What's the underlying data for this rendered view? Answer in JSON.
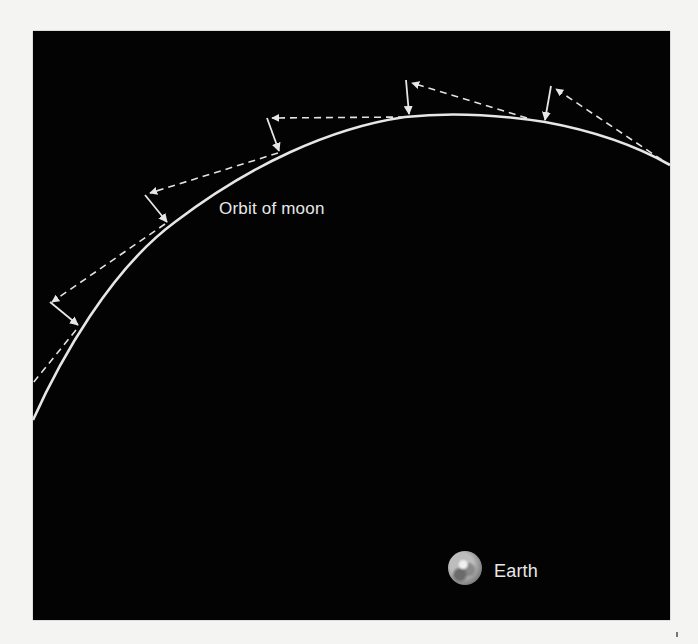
{
  "diagram": {
    "labels": {
      "orbit": "Orbit of moon",
      "earth": "Earth"
    },
    "colors": {
      "background": "#030303",
      "page": "#f4f4f2",
      "line": "#e6e6e6"
    },
    "icons": {
      "earth": "earth-globe-icon"
    },
    "elements": {
      "orbit_path": "curved orbital arc",
      "velocity_vectors": "dashed tangent arrows",
      "gravity_vectors": "solid arrows toward orbit"
    }
  }
}
